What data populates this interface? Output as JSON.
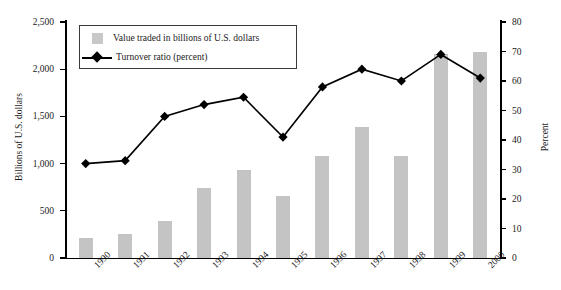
{
  "chart_data": {
    "type": "bar",
    "title": "",
    "categories": [
      "1990",
      "1991",
      "1992",
      "1993",
      "1994",
      "1995",
      "1996",
      "1997",
      "1998",
      "1999",
      "2000"
    ],
    "xlabel": "",
    "series": [
      {
        "name": "Value traded in billions of U.S. dollars",
        "type": "bar",
        "axis": "left",
        "color": "#c4c4c4",
        "values": [
          210,
          250,
          390,
          740,
          930,
          660,
          1080,
          1390,
          1080,
          2160,
          2180
        ]
      },
      {
        "name": "Turnover ratio (percent)",
        "type": "line",
        "axis": "right",
        "color": "#000000",
        "marker": "diamond",
        "values": [
          32,
          33,
          48,
          52,
          54.5,
          41,
          58,
          64,
          60,
          69,
          61
        ]
      }
    ],
    "left_axis": {
      "label": "Billions of U.S. dollars",
      "min": 0,
      "max": 2500,
      "step": 500,
      "ticks": [
        "0",
        "500",
        "1,000",
        "1,500",
        "2,000",
        "2,500"
      ],
      "tick_values": [
        0,
        500,
        1000,
        1500,
        2000,
        2500
      ]
    },
    "right_axis": {
      "label": "Percent",
      "min": 0,
      "max": 80,
      "step": 10,
      "ticks": [
        "0",
        "10",
        "20",
        "30",
        "40",
        "50",
        "60",
        "70",
        "80"
      ],
      "tick_values": [
        0,
        10,
        20,
        30,
        40,
        50,
        60,
        70,
        80
      ]
    },
    "grid": false,
    "legend_position": "top-left"
  },
  "legend": {
    "items": [
      {
        "label": "Value traded in billions of U.S. dollars",
        "marker": "swatch",
        "color": "#c8c8c8"
      },
      {
        "label": "Turnover ratio (percent)",
        "marker": "line-diamond",
        "color": "#000000"
      }
    ]
  },
  "top_caption": "",
  "colors": {
    "bar_fill": "#c4c4c4",
    "line": "#000000",
    "axis": "#000000",
    "legend_border": "#3a3a3a",
    "background": "#ffffff"
  }
}
